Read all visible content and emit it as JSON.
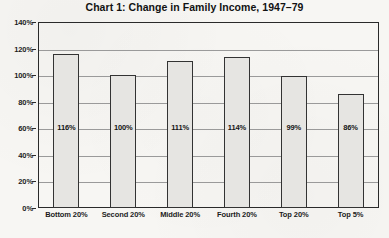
{
  "chart_data": {
    "type": "bar",
    "title": "Chart 1: Change in Family Income, 1947–79",
    "xlabel": "",
    "ylabel": "",
    "categories": [
      "Bottom 20%",
      "Second 20%",
      "Middle 20%",
      "Fourth 20%",
      "Top 20%",
      "Top 5%"
    ],
    "values": [
      116,
      100,
      111,
      114,
      99,
      86
    ],
    "value_labels": [
      "116%",
      "100%",
      "111%",
      "114%",
      "99%",
      "86%"
    ],
    "ylim": [
      0,
      140
    ],
    "yticks": [
      0,
      20,
      40,
      60,
      80,
      100,
      120,
      140
    ],
    "ytick_labels": [
      "0%",
      "20%",
      "40%",
      "60%",
      "80%",
      "100%",
      "120%",
      "140%"
    ],
    "grid": true,
    "grid_axis": "y",
    "legend": false,
    "legend_position": "none",
    "series": [
      {
        "name": "Change in Family Income 1947-79",
        "values": [
          116,
          100,
          111,
          114,
          99,
          86
        ]
      }
    ],
    "bar_fill_color": "#e6e5e2",
    "bar_border_color": "#333333",
    "background_color": "#f7f6f3",
    "text_color": "#1a1a1a",
    "gridline_color": "#9a9a9a"
  }
}
